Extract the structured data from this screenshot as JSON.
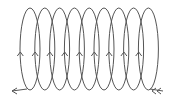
{
  "diagram": {
    "stroke_color": "#555555",
    "background": "#ffffff",
    "loops": {
      "count": 9,
      "first_left_x": 20,
      "spacing": 14.8,
      "width": 20,
      "top_y": 8,
      "bottom_y": 90,
      "arrow_y": 52,
      "arrow_direction": "up"
    },
    "lead_in": {
      "from_x": 163,
      "to_x": 150,
      "y": 91,
      "arrow": "left"
    },
    "lead_out": {
      "from_x": 27,
      "to_x": 12,
      "y": 91,
      "arrow": "left"
    }
  }
}
